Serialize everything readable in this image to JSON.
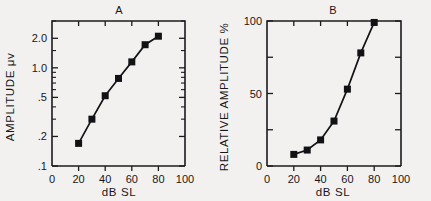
{
  "figure": {
    "background_color": "#f2f1ef",
    "ink_color": "#17171a"
  },
  "panels": {
    "a": {
      "title": "A",
      "xlabel": "dB SL",
      "ylabel": "AMPLITUDE  μv",
      "x_ticks": [
        "0",
        "20",
        "40",
        "60",
        "80",
        "100"
      ],
      "y_ticks": [
        ".1",
        ".2",
        ".5",
        "1.0",
        "2.0"
      ]
    },
    "b": {
      "title": "B",
      "xlabel": "dB SL",
      "ylabel": "RELATIVE AMPLITUDE %",
      "x_ticks": [
        "0",
        "20",
        "40",
        "60",
        "80",
        "100"
      ],
      "y_ticks": [
        "0",
        "50",
        "100"
      ]
    }
  },
  "chart_data": [
    {
      "type": "line",
      "panel": "A",
      "title": "A",
      "xlabel": "dB SL",
      "ylabel": "AMPLITUDE μv",
      "xlim": [
        0,
        100
      ],
      "ylim": [
        0.1,
        3.0
      ],
      "yscale": "log",
      "xscale": "linear",
      "grid": false,
      "legend": "none",
      "marker": "square",
      "x_tick_values": [
        0,
        20,
        40,
        60,
        80,
        100
      ],
      "x_tick_labels": [
        "0",
        "20",
        "40",
        "60",
        "80",
        "100"
      ],
      "y_tick_values": [
        0.1,
        0.2,
        0.5,
        1.0,
        2.0
      ],
      "y_tick_labels": [
        ".1",
        ".2",
        ".5",
        "1.0",
        "2.0"
      ],
      "y_minor_tick_values": [
        0.3,
        0.4,
        0.6,
        0.7,
        0.8,
        0.9,
        1.5,
        3.0
      ],
      "x": [
        20,
        30,
        40,
        50,
        60,
        70,
        80
      ],
      "values": [
        0.17,
        0.3,
        0.52,
        0.78,
        1.15,
        1.72,
        2.1
      ]
    },
    {
      "type": "line",
      "panel": "B",
      "title": "B",
      "xlabel": "dB SL",
      "ylabel": "RELATIVE AMPLITUDE %",
      "xlim": [
        0,
        100
      ],
      "ylim": [
        0,
        100
      ],
      "yscale": "linear",
      "xscale": "linear",
      "grid": false,
      "legend": "none",
      "marker": "square",
      "x_tick_values": [
        0,
        20,
        40,
        60,
        80,
        100
      ],
      "x_tick_labels": [
        "0",
        "20",
        "40",
        "60",
        "80",
        "100"
      ],
      "y_tick_values": [
        0,
        50,
        100
      ],
      "y_tick_labels": [
        "0",
        "50",
        "100"
      ],
      "y_minor_tick_values": [
        25,
        75
      ],
      "x": [
        20,
        30,
        40,
        50,
        60,
        70,
        80
      ],
      "values": [
        8,
        11,
        18,
        31,
        53,
        78,
        99
      ]
    }
  ]
}
